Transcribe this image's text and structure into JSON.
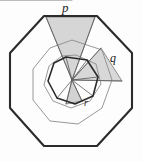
{
  "figure": {
    "width": 143,
    "height": 162,
    "background_color": "#fdfdfd",
    "center": {
      "x": 72,
      "y": 80
    },
    "colors": {
      "outer_stroke": "#2b2b2b",
      "inner_stroke": "#2b2b2b",
      "mid_stroke": "#8c8c8c",
      "sector_fill": "#d6d6d6",
      "sector_stroke": "#7a7a7a",
      "spoke_stroke": "#5a5a5a",
      "label_color": "#1a1a1a"
    },
    "stroke_widths": {
      "outer": 2.1,
      "inner": 1.6,
      "mid": 0.9,
      "sector": 0.8,
      "spoke": 0.8
    }
  },
  "labels": [
    {
      "id": "p",
      "text": "p",
      "x": 62,
      "y": 1,
      "font_size": 13,
      "describes": "angle-sector-p"
    },
    {
      "id": "q",
      "text": "q",
      "x": 110,
      "y": 52,
      "font_size": 12,
      "describes": "angle-sector-q"
    },
    {
      "id": "r",
      "text": "r",
      "x": 84,
      "y": 98,
      "font_size": 10,
      "describes": "angle-sector-r"
    }
  ],
  "shapes": {
    "outer_octagon": {
      "name": "outer-octagon",
      "sides": 8,
      "stroke": "#2b2b2b",
      "stroke_width": 2.1,
      "fill": "none",
      "points": "44,16 97,16 132,53 132,108 97,146 44,146 10,108 10,53"
    },
    "mid_nonagon_large": {
      "name": "mid-nonagon-large",
      "sides": 9,
      "stroke": "#8c8c8c",
      "stroke_width": 0.9,
      "fill": "none",
      "points": "72,40 102,50 112,80 102,108 78,124 50,121 33,100 33,69 50,48"
    },
    "mid_nonagon_small": {
      "name": "mid-nonagon-small",
      "sides": 9,
      "stroke": "#8c8c8c",
      "stroke_width": 0.9,
      "fill": "none",
      "points": "76,55 96,64 101,84 90,101 71,108 53,101 44,85 49,66 62,56"
    },
    "inner_octagon": {
      "name": "inner-octagon",
      "sides": 8,
      "stroke": "#2b2b2b",
      "stroke_width": 1.6,
      "fill": "none",
      "points": "66,57 87,60 98,77 93,96 75,104 57,98 48,81 54,63"
    }
  },
  "sectors": [
    {
      "id": "sector-p",
      "name": "angle-sector-p",
      "label": "p",
      "fill": "#d6d6d6",
      "stroke": "#7a7a7a",
      "points": "72,80 46,17 95,17"
    },
    {
      "id": "sector-q",
      "name": "angle-sector-q",
      "label": "q",
      "fill": "#d8d8d8",
      "stroke": "#7a7a7a",
      "points": "72,80 101,48 122,81"
    },
    {
      "id": "sector-r",
      "name": "angle-sector-r",
      "label": "r",
      "fill": "#d2d2d2",
      "stroke": "#7a7a7a",
      "points": "72,80 82,101 66,104"
    }
  ],
  "spokes": [
    {
      "name": "spoke-to-vertex-1",
      "x1": 72,
      "y1": 80,
      "x2": 46,
      "y2": 17
    },
    {
      "name": "spoke-to-vertex-2",
      "x1": 72,
      "y1": 80,
      "x2": 95,
      "y2": 17
    },
    {
      "name": "spoke-to-vertex-3",
      "x1": 72,
      "y1": 80,
      "x2": 101,
      "y2": 48
    },
    {
      "name": "spoke-to-vertex-4",
      "x1": 72,
      "y1": 80,
      "x2": 122,
      "y2": 81
    },
    {
      "name": "spoke-to-vertex-5",
      "x1": 72,
      "y1": 80,
      "x2": 98,
      "y2": 77
    },
    {
      "name": "spoke-to-vertex-6",
      "x1": 72,
      "y1": 80,
      "x2": 93,
      "y2": 96
    },
    {
      "name": "spoke-to-vertex-7",
      "x1": 72,
      "y1": 80,
      "x2": 82,
      "y2": 101
    },
    {
      "name": "spoke-to-vertex-8",
      "x1": 72,
      "y1": 80,
      "x2": 66,
      "y2": 104
    },
    {
      "name": "spoke-to-vertex-9",
      "x1": 72,
      "y1": 80,
      "x2": 57,
      "y2": 98
    },
    {
      "name": "spoke-to-vertex-10",
      "x1": 72,
      "y1": 80,
      "x2": 66,
      "y2": 57
    },
    {
      "name": "spoke-to-vertex-11",
      "x1": 72,
      "y1": 80,
      "x2": 87,
      "y2": 60
    }
  ]
}
